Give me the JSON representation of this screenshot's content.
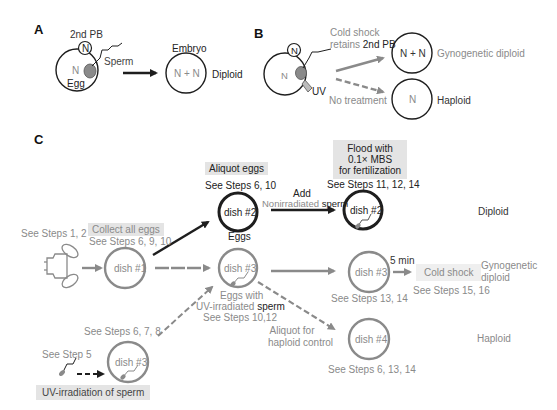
{
  "panel_a": {
    "label": "A",
    "polar_body": "2nd PB",
    "polar_body_nucleus": "N",
    "egg_nucleus": "N",
    "egg_label": "Egg",
    "sperm_label": "Sperm",
    "embryo_label": "Embryo",
    "embryo_content": "N + N",
    "result": "Diploid"
  },
  "panel_b": {
    "label": "B",
    "polar_body_nucleus": "N",
    "egg_nucleus": "N",
    "uv_label": "UV",
    "cold_shock_line1": "Cold shock",
    "cold_shock_line2_gray": "retains ",
    "cold_shock_line2_dark": "2nd PB",
    "no_treatment": "No treatment",
    "gyno_content": "N + N",
    "gyno_result": "Gynogenetic diploid",
    "haploid_content": "N",
    "haploid_result": "Haploid"
  },
  "panel_c": {
    "label": "C",
    "see_steps_1_2": "See Steps 1, 2",
    "collect_box": "Collect all eggs",
    "collect_steps": "See Steps 6, 9, 10",
    "aliquot_box": "Aliquot eggs",
    "aliquot_steps": "See Steps 6, 10",
    "eggs_label": "Eggs",
    "add_label": "Add",
    "nonirradiated_gray": "Nonirradiated",
    "nonirradiated_dark": " sperm",
    "flood_box_line1": "Flood with",
    "flood_box_line2": "0.1× MBS",
    "flood_box_line3": "for fertilization",
    "flood_steps": "See Steps 11, 12, 14",
    "diploid_result": "Diploid",
    "dish1": "dish #1",
    "dish2": "dish #2",
    "dish2b": "dish #2",
    "dish3": "dish #3",
    "dish3b": "dish #3",
    "dish3c": "dish #3",
    "dish4": "dish #4",
    "eggs_with": "Eggs with",
    "uv_irradiated_gray": "UV-irradiated",
    "uv_irradiated_dark": " sperm",
    "steps_10_12": "See Steps 10,12",
    "five_min": "5 min",
    "cold_shock_box": "Cold shock",
    "gyno_line1": "Gynogenetic",
    "gyno_line2": "diploid",
    "steps_15_16": "See Steps 15, 16",
    "steps_13_14": "See Steps 13, 14",
    "aliquot_for_line1": "Aliquot for",
    "aliquot_for_line2": "haploid control",
    "haploid_result": "Haploid",
    "steps_6_13_14": "See Steps 6, 13, 14",
    "steps_6_7_8": "See Steps 6, 7, 8",
    "see_step_5": "See Step 5",
    "uv_box": "UV-irradiation of sperm"
  },
  "colors": {
    "dark": "#1e1e1e",
    "gray": "#8a8a8a",
    "box": "#e4e4e4"
  }
}
